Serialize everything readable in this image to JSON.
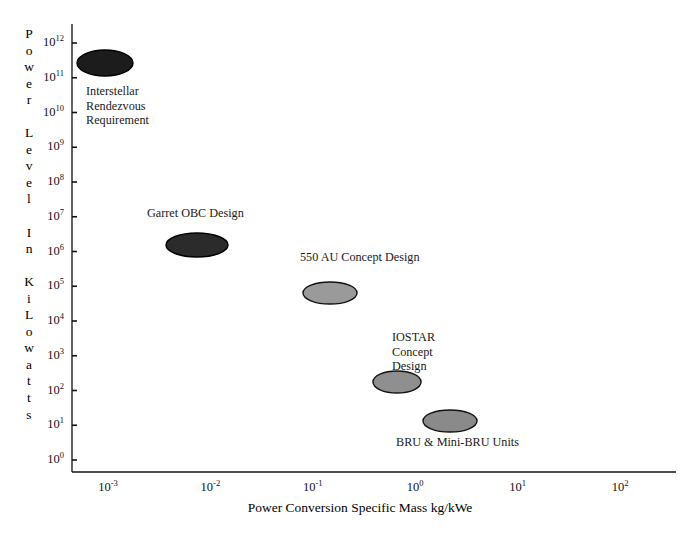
{
  "chart_data": {
    "type": "scatter",
    "title": "",
    "xlabel": "Power Conversion Specific Mass kg/kWe",
    "ylabel": "Power Level In KiLowatts",
    "ylabel_letters": [
      "P",
      "o",
      "w",
      "e",
      "r",
      "",
      "L",
      "e",
      "v",
      "e",
      "l",
      "",
      "I",
      "n",
      "",
      "K",
      "i",
      "L",
      "o",
      "w",
      "a",
      "t",
      "t",
      "s"
    ],
    "xscale": "log",
    "yscale": "log",
    "xlim": [
      0.001,
      100
    ],
    "ylim": [
      1,
      1000000000000
    ],
    "grid": false,
    "legend": false,
    "xticks": [
      {
        "label_base": "10",
        "label_exp": "-3",
        "value": 0.001
      },
      {
        "label_base": "10",
        "label_exp": "-2",
        "value": 0.01
      },
      {
        "label_base": "10",
        "label_exp": "-1",
        "value": 0.1
      },
      {
        "label_base": "10",
        "label_exp": "0",
        "value": 1
      },
      {
        "label_base": "10",
        "label_exp": "1",
        "value": 10
      },
      {
        "label_base": "10",
        "label_exp": "2",
        "value": 100
      }
    ],
    "yticks": [
      {
        "label_base": "10",
        "label_exp": "12",
        "value": 1000000000000
      },
      {
        "label_base": "10",
        "label_exp": "11",
        "value": 100000000000
      },
      {
        "label_base": "10",
        "label_exp": "10",
        "value": 10000000000
      },
      {
        "label_base": "10",
        "label_exp": "9",
        "value": 1000000000
      },
      {
        "label_base": "10",
        "label_exp": "8",
        "value": 100000000
      },
      {
        "label_base": "10",
        "label_exp": "7",
        "value": 10000000
      },
      {
        "label_base": "10",
        "label_exp": "6",
        "value": 1000000
      },
      {
        "label_base": "10",
        "label_exp": "5",
        "value": 100000
      },
      {
        "label_base": "10",
        "label_exp": "4",
        "value": 10000
      },
      {
        "label_base": "10",
        "label_exp": "3",
        "value": 1000
      },
      {
        "label_base": "10",
        "label_exp": "2",
        "value": 100
      },
      {
        "label_base": "10",
        "label_exp": "1",
        "value": 10
      },
      {
        "label_base": "10",
        "label_exp": "0",
        "value": 1
      }
    ],
    "points": [
      {
        "name": "Interstellar Rendezvous Requirement",
        "label": "Interstellar\nRendezvous\nRequirement",
        "x": 0.0012,
        "y": 400000000000,
        "fill": "#1c1c1c",
        "stroke": "#000000",
        "rx": 28,
        "ry": 13,
        "cx_px": 105,
        "cy_px": 63,
        "label_x_px": 86,
        "label_y_px": 84,
        "label_align": "left"
      },
      {
        "name": "Garret OBC Design",
        "label": "Garret OBC Design",
        "x": 0.009,
        "y": 3500000,
        "fill": "#2b2b2b",
        "stroke": "#000000",
        "rx": 31,
        "ry": 12,
        "cx_px": 197,
        "cy_px": 245,
        "label_x_px": 147,
        "label_y_px": 206,
        "label_align": "left"
      },
      {
        "name": "550 AU Concept Design",
        "label": "550 AU Concept Design",
        "x": 0.19,
        "y": 110000,
        "fill": "#9a9a9a",
        "stroke": "#121212",
        "rx": 27,
        "ry": 11,
        "cx_px": 330,
        "cy_px": 293,
        "label_x_px": 300,
        "label_y_px": 250,
        "label_align": "left"
      },
      {
        "name": "IOSTAR Concept Design",
        "label": "IOSTAR\nConcept\nDesign",
        "x": 0.95,
        "y": 180,
        "fill": "#8f8f8f",
        "stroke": "#121212",
        "rx": 24,
        "ry": 11,
        "cx_px": 397,
        "cy_px": 382,
        "label_x_px": 392,
        "label_y_px": 330,
        "label_align": "left"
      },
      {
        "name": "BRU & Mini-BRU Units",
        "label": "BRU & Mini-BRU Units",
        "x": 4.0,
        "y": 18,
        "fill": "#8a8a8a",
        "stroke": "#121212",
        "rx": 27,
        "ry": 11,
        "cx_px": 450,
        "cy_px": 421,
        "label_x_px": 396,
        "label_y_px": 435,
        "label_align": "left"
      }
    ]
  },
  "axes": {
    "left_px": 72,
    "right_px": 676,
    "top_px": 24,
    "bottom_px": 472,
    "axis_color": "#111111",
    "background": "#ffffff"
  }
}
